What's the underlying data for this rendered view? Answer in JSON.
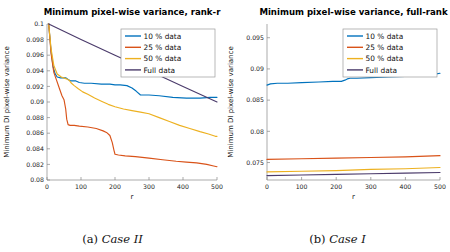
{
  "figure": {
    "panels": [
      {
        "key": "left",
        "caption_label": "(a)",
        "caption_case": "Case II",
        "chart_data": {
          "type": "line",
          "title": "Minimum pixel-wise variance, rank-r",
          "xlabel": "r",
          "ylabel": "Minimum DI pixel-wise variance",
          "xlim": [
            0,
            500
          ],
          "ylim": [
            0.08,
            0.1
          ],
          "xticks": [
            0,
            100,
            200,
            300,
            400,
            500
          ],
          "xticklabels": [
            "0",
            "100",
            "200",
            "300",
            "400",
            "500"
          ],
          "yticks": [
            0.08,
            0.082,
            0.084,
            0.086,
            0.088,
            0.09,
            0.092,
            0.094,
            0.096,
            0.098,
            0.1
          ],
          "yticklabels": [
            "0.08",
            "0.082",
            "0.084",
            "0.086",
            "0.088",
            "0.09",
            "0.092",
            "0.094",
            "0.096",
            "0.098",
            "0.1"
          ],
          "grid": false,
          "legend_position": "upper right",
          "series": [
            {
              "name": "10 % data",
              "color": "#0072BD",
              "x": [
                5,
                12,
                18,
                24,
                30,
                40,
                55,
                62,
                70,
                85,
                95,
                110,
                130,
                160,
                185,
                200,
                215,
                235,
                250,
                262,
                275,
                300,
                330,
                370,
                410,
                450,
                480,
                500
              ],
              "y": [
                0.1,
                0.0965,
                0.0945,
                0.0936,
                0.0932,
                0.0931,
                0.0931,
                0.0929,
                0.0927,
                0.0927,
                0.0925,
                0.0924,
                0.0924,
                0.0923,
                0.0923,
                0.0922,
                0.0922,
                0.0921,
                0.0918,
                0.0914,
                0.0909,
                0.0909,
                0.0908,
                0.0906,
                0.0905,
                0.0905,
                0.0906,
                0.0906
              ]
            },
            {
              "name": "25 % data",
              "color": "#D95319",
              "x": [
                5,
                12,
                20,
                28,
                36,
                44,
                50,
                55,
                58,
                62,
                68,
                80,
                95,
                120,
                145,
                165,
                175,
                185,
                192,
                197,
                200,
                210,
                230,
                260,
                300,
                340,
                380,
                410,
                440,
                470,
                490,
                500
              ],
              "y": [
                0.1,
                0.0962,
                0.0938,
                0.0928,
                0.0918,
                0.0908,
                0.0903,
                0.0891,
                0.0878,
                0.0871,
                0.087,
                0.087,
                0.0869,
                0.0868,
                0.0866,
                0.0863,
                0.0861,
                0.0857,
                0.0848,
                0.0838,
                0.0833,
                0.0832,
                0.0831,
                0.083,
                0.0828,
                0.0826,
                0.0824,
                0.0823,
                0.0822,
                0.082,
                0.0818,
                0.0817
              ]
            },
            {
              "name": "50 % data",
              "color": "#EDB120",
              "x": [
                5,
                12,
                20,
                30,
                42,
                55,
                65,
                72,
                80,
                92,
                105,
                120,
                140,
                160,
                180,
                200,
                225,
                250,
                275,
                300,
                330,
                360,
                390,
                420,
                450,
                475,
                495,
                500
              ],
              "y": [
                0.1,
                0.0968,
                0.0947,
                0.0936,
                0.0932,
                0.093,
                0.0928,
                0.0924,
                0.0921,
                0.0917,
                0.0913,
                0.091,
                0.0905,
                0.0901,
                0.0897,
                0.0894,
                0.0891,
                0.0889,
                0.0887,
                0.0885,
                0.088,
                0.0875,
                0.087,
                0.0866,
                0.0862,
                0.0859,
                0.0856,
                0.0856
              ]
            },
            {
              "name": "Full data",
              "color": "#4B3B6B",
              "x": [
                5,
                100,
                200,
                300,
                400,
                500
              ],
              "y": [
                0.1,
                0.098,
                0.096,
                0.094,
                0.092,
                0.09
              ]
            }
          ]
        }
      },
      {
        "key": "right",
        "caption_label": "(b)",
        "caption_case": "Case I",
        "chart_data": {
          "type": "line",
          "title": "Minimum pixel-wise variance, full-rank",
          "xlabel": "r",
          "ylabel": "Minimum DI pixel-wise variance",
          "xlim": [
            0,
            500
          ],
          "ylim": [
            0.0722,
            0.0972
          ],
          "xticks": [
            0,
            100,
            200,
            300,
            400,
            500
          ],
          "xticklabels": [
            "0",
            "100",
            "200",
            "300",
            "400",
            "500"
          ],
          "yticks": [
            0.075,
            0.08,
            0.085,
            0.09,
            0.095
          ],
          "yticklabels": [
            "0.075",
            "0.08",
            "0.085",
            "0.09",
            "0.095"
          ],
          "grid": false,
          "legend_position": "upper right",
          "series": [
            {
              "name": "10 % data",
              "color": "#0072BD",
              "x": [
                0,
                10,
                30,
                60,
                100,
                150,
                190,
                215,
                225,
                232,
                240,
                260,
                300,
                350,
                400,
                440,
                470,
                490,
                500
              ],
              "y": [
                0.0874,
                0.0876,
                0.0877,
                0.0877,
                0.0878,
                0.0879,
                0.088,
                0.088,
                0.0882,
                0.0884,
                0.0885,
                0.0885,
                0.0886,
                0.0887,
                0.0888,
                0.0889,
                0.089,
                0.0892,
                0.0893
              ]
            },
            {
              "name": "25 % data",
              "color": "#D95319",
              "x": [
                0,
                100,
                200,
                300,
                400,
                500
              ],
              "y": [
                0.0755,
                0.0756,
                0.0757,
                0.0758,
                0.0759,
                0.0761
              ]
            },
            {
              "name": "50 % data",
              "color": "#EDB120",
              "x": [
                0,
                100,
                200,
                300,
                400,
                500
              ],
              "y": [
                0.0735,
                0.0736,
                0.0737,
                0.0739,
                0.074,
                0.0742
              ]
            },
            {
              "name": "Full data",
              "color": "#4B3B6B",
              "x": [
                0,
                100,
                200,
                300,
                400,
                500
              ],
              "y": [
                0.0729,
                0.073,
                0.0731,
                0.0732,
                0.0733,
                0.0734
              ]
            }
          ]
        }
      }
    ]
  }
}
